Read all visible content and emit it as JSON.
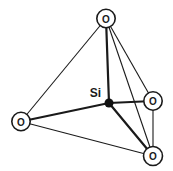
{
  "diagram": {
    "type": "molecular-structure",
    "silicon_label": "Si",
    "oxygen_label": "O",
    "atoms": [
      {
        "id": "si",
        "kind": "silicon",
        "label": "Si",
        "x": 109,
        "y": 103,
        "radius": 4.5
      },
      {
        "id": "o-top",
        "kind": "oxygen",
        "label": "O",
        "x": 106,
        "y": 18.5,
        "radius": 9.2
      },
      {
        "id": "o-left",
        "kind": "oxygen",
        "label": "O",
        "x": 21,
        "y": 121.5,
        "radius": 9.2
      },
      {
        "id": "o-right",
        "kind": "oxygen",
        "label": "O",
        "x": 153,
        "y": 101,
        "radius": 9.2
      },
      {
        "id": "o-bottom",
        "kind": "oxygen",
        "label": "O",
        "x": 153,
        "y": 156,
        "radius": 9.5
      }
    ],
    "tetrahedron_edges": [
      {
        "from": "o-top",
        "to": "o-left"
      },
      {
        "from": "o-top",
        "to": "o-right"
      },
      {
        "from": "o-top",
        "to": "o-bottom"
      },
      {
        "from": "o-left",
        "to": "o-bottom"
      },
      {
        "from": "o-right",
        "to": "o-bottom"
      }
    ],
    "bonds": [
      {
        "from": "si",
        "to": "o-top"
      },
      {
        "from": "si",
        "to": "o-left"
      },
      {
        "from": "si",
        "to": "o-right"
      },
      {
        "from": "si",
        "to": "o-bottom"
      }
    ],
    "si_label_pos": {
      "x": 101,
      "y": 97
    },
    "style": {
      "line_color": "#1a1a1a",
      "edge_width": 1.1,
      "bond_width": 2.2,
      "circle_stroke_width": 1.6,
      "circle_fill": "#ffffff",
      "si_fill": "#111111",
      "background": "#ffffff",
      "oxygen_font_size": 10,
      "si_font_size": 12
    }
  }
}
